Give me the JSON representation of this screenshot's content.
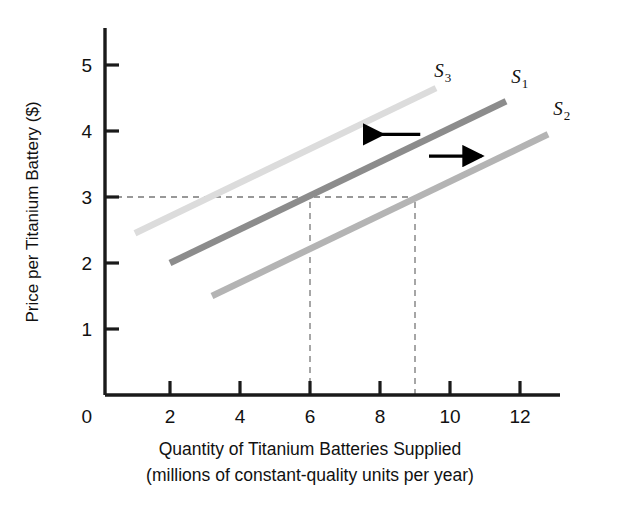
{
  "chart_data": {
    "type": "line",
    "title": "",
    "xlabel": "Quantity of Titanium Batteries Supplied",
    "xlabel_line2": "(millions of constant-quality units per year)",
    "ylabel": "Price per Titanium Battery ($)",
    "xlim": [
      0,
      13.5
    ],
    "ylim": [
      0,
      5.6
    ],
    "xticks": [
      "0",
      "2",
      "4",
      "6",
      "8",
      "10",
      "12"
    ],
    "xtick_values": [
      0,
      2,
      4,
      6,
      8,
      10,
      12
    ],
    "yticks": [
      "1",
      "2",
      "3",
      "4",
      "5"
    ],
    "ytick_values": [
      1,
      2,
      3,
      4,
      5
    ],
    "grid": false,
    "legend": "inline-curve-labels",
    "series": [
      {
        "name": "S1",
        "label": "S",
        "subscript": "1",
        "color": "#8c8c8c",
        "x": [
          2,
          11.6
        ],
        "y": [
          2.0,
          4.45
        ],
        "points": [
          [
            2,
            2.0
          ],
          [
            6,
            3.0
          ],
          [
            11.6,
            4.45
          ]
        ],
        "note": "original supply curve; crosses price 3 at quantity 6"
      },
      {
        "name": "S3",
        "label": "S",
        "subscript": "3",
        "color": "#dcdcdc",
        "x": [
          1,
          9.6
        ],
        "y": [
          2.45,
          4.65
        ],
        "points": [
          [
            1,
            2.45
          ],
          [
            3,
            3.0
          ],
          [
            9.6,
            4.65
          ]
        ],
        "note": "leftward shift of supply (decrease in supply)"
      },
      {
        "name": "S2",
        "label": "S",
        "subscript": "2",
        "color": "#b4b4b4",
        "x": [
          3.2,
          12.8
        ],
        "y": [
          1.5,
          3.95
        ],
        "points": [
          [
            3.2,
            1.5
          ],
          [
            9,
            3.0
          ],
          [
            12.8,
            3.95
          ]
        ],
        "note": "rightward shift of supply (increase in supply); crosses price 3 at quantity 9"
      }
    ],
    "reference_lines": [
      {
        "name": "price-3-horizontal",
        "orientation": "horizontal",
        "value": 3,
        "from": 0,
        "to": 9,
        "style": "dashed"
      },
      {
        "name": "quantity-6-vertical",
        "orientation": "vertical",
        "value": 6,
        "from": 0,
        "to": 3,
        "style": "dashed"
      },
      {
        "name": "quantity-9-vertical",
        "orientation": "vertical",
        "value": 9,
        "from": 0,
        "to": 3,
        "style": "dashed"
      }
    ],
    "annotations": [
      {
        "name": "leftward-shift-arrow",
        "direction": "left",
        "x_from": 9.15,
        "x_to": 7.6,
        "y": 3.95,
        "color": "#000000"
      },
      {
        "name": "rightward-shift-arrow",
        "direction": "right",
        "x_from": 9.4,
        "x_to": 10.9,
        "y": 3.62,
        "color": "#000000"
      }
    ],
    "curve_labels": [
      {
        "name": "S3",
        "label": "S",
        "subscript": "3",
        "x": 9.55,
        "y": 4.82
      },
      {
        "name": "S1",
        "label": "S",
        "subscript": "1",
        "x": 11.75,
        "y": 4.72
      },
      {
        "name": "S2",
        "label": "S",
        "subscript": "2",
        "x": 12.95,
        "y": 4.25
      }
    ]
  },
  "colors": {
    "axis": "#1a1a1a",
    "background": "#ffffff",
    "dashed": "#777777",
    "s1": "#8c8c8c",
    "s2": "#b4b4b4",
    "s3": "#dcdcdc",
    "arrow": "#000000"
  }
}
